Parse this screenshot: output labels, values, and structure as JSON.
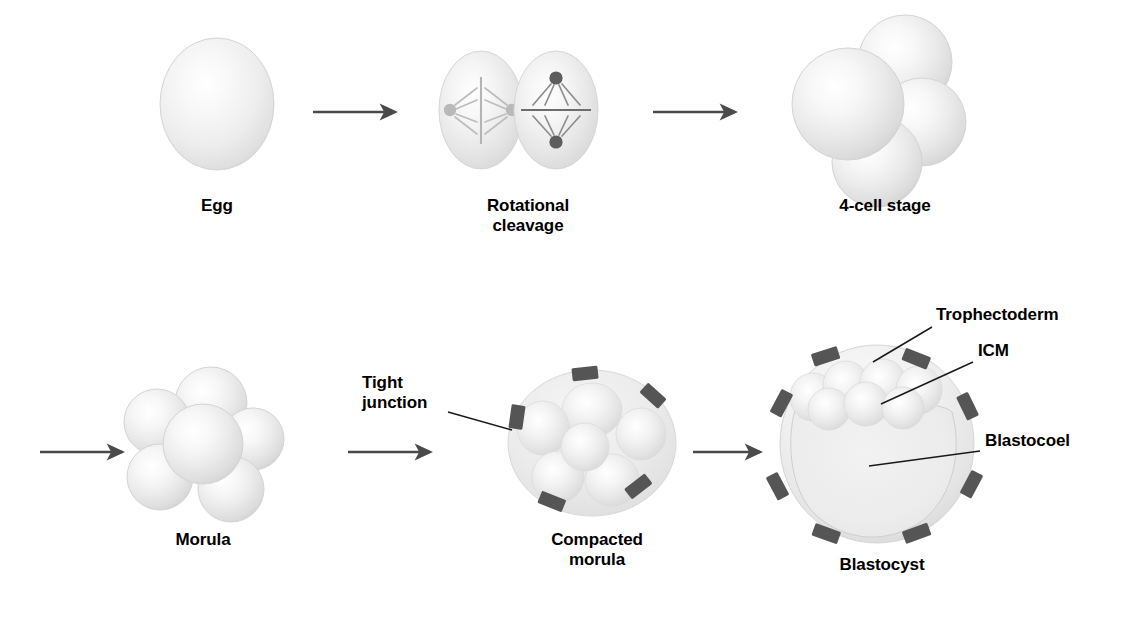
{
  "figure": {
    "background_color": "#ffffff",
    "ink_color": "#000000",
    "arrow_color": "#4a4a4a",
    "cell_fill_light": "#ffffff",
    "cell_fill_mid": "#e2e2e2",
    "cell_fill_edge": "#cfcfcf",
    "junction_color": "#555555",
    "leader_color": "#1a1a1a"
  },
  "stages": {
    "egg": {
      "label": "Egg"
    },
    "rotational_cleavage": {
      "label": "Rotational\ncleavage"
    },
    "four_cell": {
      "label": "4-cell stage"
    },
    "morula": {
      "label": "Morula"
    },
    "compacted_morula": {
      "label": "Compacted\nmorula"
    },
    "blastocyst": {
      "label": "Blastocyst"
    }
  },
  "callouts": {
    "tight_junction": {
      "label": "Tight\njunction"
    },
    "trophectoderm": {
      "label": "Trophectoderm"
    },
    "icm": {
      "label": "ICM"
    },
    "blastocoel": {
      "label": "Blastocoel"
    }
  },
  "sequence": {
    "row_one": [
      "Egg",
      "Rotational cleavage",
      "4-cell stage"
    ],
    "row_two": [
      "Morula",
      "Compacted morula",
      "Blastocyst"
    ]
  },
  "counts": {
    "egg_cells": 1,
    "rotational_cleavage_cells": 2,
    "four_cell_cells": 4,
    "morula_cells": 6,
    "compacted_morula_cells": 6,
    "compacted_morula_tight_junctions": 5,
    "blastocyst_tight_junctions": 8,
    "blastocyst_icm_cells": 7,
    "arrows": 5
  }
}
